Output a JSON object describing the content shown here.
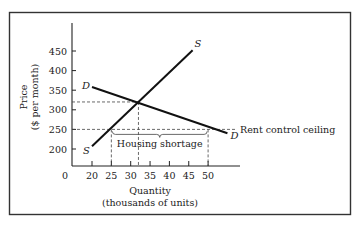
{
  "chart_data": {
    "type": "line",
    "title": "",
    "xlabel": "Quantity",
    "xlabel_sub": "(thousands of units)",
    "ylabel": "Price",
    "ylabel_sub": "($ per month)",
    "xlim": [
      0,
      58
    ],
    "ylim": [
      180,
      480
    ],
    "x_ticks": [
      20,
      25,
      30,
      35,
      40,
      45,
      50
    ],
    "x_tick_labels": [
      "20",
      "25",
      "30",
      "35",
      "40",
      "45",
      "50"
    ],
    "x_origin_label": "0",
    "y_ticks": [
      200,
      250,
      300,
      350,
      400,
      450
    ],
    "y_tick_labels": [
      "200",
      "250",
      "300",
      "350",
      "400",
      "450"
    ],
    "grid": false,
    "series": [
      {
        "name": "Supply",
        "label": "S",
        "x": [
          20,
          46
        ],
        "y": [
          207,
          452
        ]
      },
      {
        "name": "Demand",
        "label": "D",
        "x": [
          20,
          55
        ],
        "y": [
          358,
          240
        ]
      }
    ],
    "equilibrium": {
      "quantity": 32,
      "price": 320
    },
    "ceiling": {
      "price": 250,
      "label": "Rent control ceiling",
      "quantity_supplied": 25,
      "quantity_demanded": 50
    },
    "annotations": [
      {
        "text": "Housing shortage",
        "from_quantity": 25,
        "to_quantity": 50
      }
    ]
  }
}
